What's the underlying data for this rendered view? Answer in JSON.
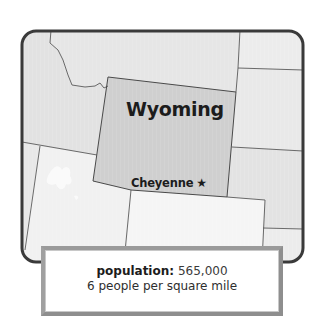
{
  "map": {
    "state_name": "Wyoming",
    "capital": "Cheyenne",
    "capital_marker": "★",
    "capital_marker_icon": "star-icon",
    "colors": {
      "highlight_state": "#cfcfcf",
      "neighbor_state": "#e3e3e3",
      "light_state": "#f4f4f4",
      "border": "#555555",
      "frame": "#3a3a3a"
    }
  },
  "info": {
    "population_label": "population:",
    "population_value": "565,000",
    "density_text": "6 people per square mile"
  }
}
